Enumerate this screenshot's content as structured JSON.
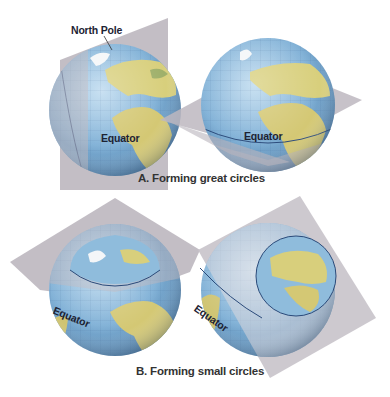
{
  "labels": {
    "north_pole": "North Pole",
    "equator_a1": "Equator",
    "equator_a2": "Equator",
    "equator_b1": "Equator",
    "equator_b2": "Equator"
  },
  "captions": {
    "a": "A. Forming great circles",
    "b": "B. Forming small circles"
  },
  "colors": {
    "ocean": "#7fb0d6",
    "land": "#d9cf7a",
    "plane": "#b9b4bc",
    "circle_line": "#2a4a7a"
  }
}
